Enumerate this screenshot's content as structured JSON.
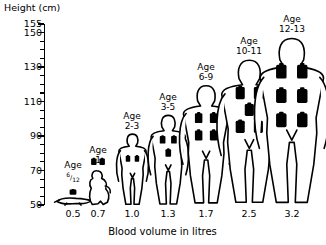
{
  "chart_data": {
    "type": "bar",
    "title": "",
    "xlabel": "Blood volume in litres",
    "ylabel": "Height (cm)",
    "ylim": [
      50,
      155
    ],
    "ytick_labels": [
      "155",
      "150",
      "130",
      "110",
      "90",
      "70",
      "50"
    ],
    "ytick_values": [
      155,
      150,
      130,
      110,
      90,
      70,
      50
    ],
    "ytick_step_minor": 5,
    "grid": false,
    "legend": "none",
    "categories": [
      "6/12",
      "1",
      "2-3",
      "3-5",
      "6-9",
      "10-11",
      "12-13"
    ],
    "x": [
      0.5,
      0.7,
      1.0,
      1.3,
      1.7,
      2.5,
      3.2
    ],
    "xtick_labels": [
      "0.5",
      "0.7",
      "1.0",
      "1.3",
      "1.7",
      "2.5",
      "3.2"
    ],
    "series": [
      {
        "name": "Height (cm)",
        "values": [
          60,
          72,
          92,
          103,
          120,
          135,
          148
        ]
      },
      {
        "name": "Blood volume in litres",
        "values": [
          0.5,
          0.7,
          1.0,
          1.3,
          1.7,
          2.5,
          3.2
        ]
      },
      {
        "name": "Bottle icons shown",
        "values": [
          1,
          2,
          2,
          3,
          4,
          5,
          6
        ]
      }
    ],
    "figures": [
      {
        "age": "6/12",
        "age_prefix": "Age",
        "age_numer": "6",
        "age_denom": "12",
        "volume": "0.5",
        "height_cm": 60,
        "bottles": 1,
        "pose": "crawling-baby"
      },
      {
        "age": "1",
        "age_prefix": "Age",
        "volume": "0.7",
        "height_cm": 72,
        "bottles": 2,
        "pose": "toddler"
      },
      {
        "age": "2-3",
        "age_prefix": "Age",
        "volume": "1.0",
        "height_cm": 92,
        "bottles": 2,
        "pose": "standing-child"
      },
      {
        "age": "3-5",
        "age_prefix": "Age",
        "volume": "1.3",
        "height_cm": 103,
        "bottles": 3,
        "pose": "standing-child"
      },
      {
        "age": "6-9",
        "age_prefix": "Age",
        "volume": "1.7",
        "height_cm": 120,
        "bottles": 4,
        "pose": "standing-child"
      },
      {
        "age": "10-11",
        "age_prefix": "Age",
        "volume": "2.5",
        "height_cm": 135,
        "bottles": 5,
        "pose": "standing-child"
      },
      {
        "age": "12-13",
        "age_prefix": "Age",
        "volume": "3.2",
        "height_cm": 148,
        "bottles": 6,
        "pose": "standing-child"
      }
    ]
  },
  "axes": {
    "y_title": "Height (cm)",
    "x_title": "Blood volume in litres"
  },
  "colors": {
    "ink": "#000000",
    "paper": "#ffffff",
    "bottle_fill": "#000000"
  }
}
